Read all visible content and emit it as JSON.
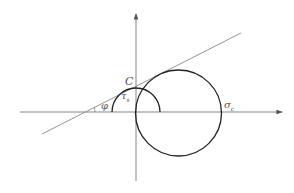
{
  "diagram": {
    "type": "mohr-coulomb-envelope",
    "labels": {
      "cohesion": "C",
      "friction_angle": "φ",
      "shear_strength": "τ",
      "shear_strength_sub": "s",
      "compressive_strength": "σ",
      "compressive_strength_sub": "c"
    },
    "colors": {
      "axis": "#555555",
      "circle": "#222222",
      "envelope": "#777777",
      "text": "#555555"
    }
  }
}
